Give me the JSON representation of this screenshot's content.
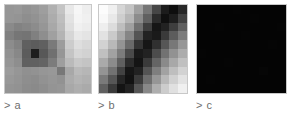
{
  "figure": {
    "background_color": "#ffffff",
    "label_color": "#6e6e6e",
    "border_color": "#c8c8c8",
    "panel_count": 3
  },
  "panels": [
    {
      "label": "> a",
      "name": "panel-a",
      "x": 4,
      "width": 88,
      "height": 90,
      "description": "grayscale heatmap with dark blob left-of-center and bright region upper-right"
    },
    {
      "label": "> b",
      "name": "panel-b",
      "x": 98,
      "width": 90,
      "height": 90,
      "description": "grayscale heatmap with dark diagonal band from bottom-left to top-right"
    },
    {
      "label": "> c",
      "name": "panel-c",
      "x": 196,
      "width": 91,
      "height": 90,
      "description": "uniform near-black grayscale heatmap"
    }
  ],
  "chart_data": [
    {
      "type": "heatmap",
      "name": "a",
      "title": "> a",
      "xlabel": "",
      "ylabel": "",
      "rows": 10,
      "cols": 10,
      "colormap": "gray",
      "vmin": 0,
      "vmax": 255,
      "legend": "none",
      "grid": false,
      "values": [
        [
          150,
          152,
          146,
          150,
          158,
          176,
          196,
          232,
          246,
          238
        ],
        [
          150,
          148,
          142,
          146,
          154,
          172,
          190,
          226,
          244,
          240
        ],
        [
          138,
          130,
          134,
          140,
          150,
          168,
          186,
          222,
          240,
          236
        ],
        [
          128,
          118,
          116,
          128,
          142,
          160,
          180,
          214,
          232,
          228
        ],
        [
          140,
          130,
          96,
          92,
          96,
          122,
          156,
          204,
          222,
          216
        ],
        [
          146,
          136,
          92,
          30,
          88,
          112,
          150,
          196,
          214,
          210
        ],
        [
          150,
          142,
          96,
          96,
          100,
          124,
          158,
          186,
          200,
          196
        ],
        [
          156,
          150,
          144,
          146,
          150,
          152,
          120,
          168,
          186,
          182
        ],
        [
          152,
          148,
          142,
          140,
          146,
          150,
          146,
          172,
          180,
          176
        ],
        [
          148,
          146,
          140,
          138,
          142,
          148,
          150,
          168,
          174,
          170
        ]
      ]
    },
    {
      "type": "heatmap",
      "name": "b",
      "title": "> b",
      "xlabel": "",
      "ylabel": "",
      "rows": 10,
      "cols": 10,
      "colormap": "gray",
      "vmin": 0,
      "vmax": 255,
      "legend": "none",
      "grid": false,
      "values": [
        [
          252,
          240,
          214,
          196,
          160,
          118,
          70,
          28,
          14,
          40
        ],
        [
          248,
          232,
          206,
          182,
          140,
          96,
          44,
          16,
          30,
          66
        ],
        [
          238,
          220,
          190,
          160,
          112,
          62,
          22,
          34,
          62,
          96
        ],
        [
          226,
          202,
          170,
          134,
          84,
          34,
          26,
          58,
          92,
          124
        ],
        [
          210,
          184,
          148,
          106,
          52,
          22,
          48,
          86,
          120,
          150
        ],
        [
          192,
          162,
          124,
          74,
          26,
          34,
          76,
          114,
          146,
          172
        ],
        [
          170,
          140,
          96,
          44,
          20,
          58,
          100,
          138,
          168,
          192
        ],
        [
          148,
          114,
          66,
          22,
          34,
          84,
          126,
          162,
          190,
          210
        ],
        [
          122,
          86,
          38,
          18,
          58,
          110,
          150,
          184,
          208,
          226
        ],
        [
          96,
          58,
          20,
          34,
          86,
          136,
          174,
          204,
          224,
          240
        ]
      ]
    },
    {
      "type": "heatmap",
      "name": "c",
      "title": "> c",
      "xlabel": "",
      "ylabel": "",
      "rows": 10,
      "cols": 10,
      "colormap": "gray",
      "vmin": 0,
      "vmax": 255,
      "legend": "none",
      "grid": false,
      "values": [
        [
          4,
          4,
          4,
          4,
          5,
          4,
          4,
          4,
          4,
          4
        ],
        [
          4,
          4,
          4,
          4,
          4,
          4,
          5,
          4,
          4,
          4
        ],
        [
          4,
          4,
          5,
          4,
          4,
          4,
          4,
          4,
          4,
          5
        ],
        [
          4,
          4,
          4,
          4,
          4,
          5,
          4,
          4,
          4,
          4
        ],
        [
          4,
          4,
          4,
          4,
          4,
          4,
          4,
          4,
          5,
          4
        ],
        [
          5,
          4,
          4,
          4,
          4,
          4,
          4,
          4,
          4,
          4
        ],
        [
          4,
          4,
          4,
          5,
          4,
          4,
          4,
          4,
          4,
          4
        ],
        [
          4,
          4,
          4,
          4,
          4,
          4,
          4,
          6,
          4,
          4
        ],
        [
          4,
          5,
          4,
          4,
          4,
          4,
          4,
          4,
          4,
          4
        ],
        [
          4,
          4,
          4,
          4,
          4,
          4,
          4,
          4,
          4,
          4
        ]
      ]
    }
  ]
}
